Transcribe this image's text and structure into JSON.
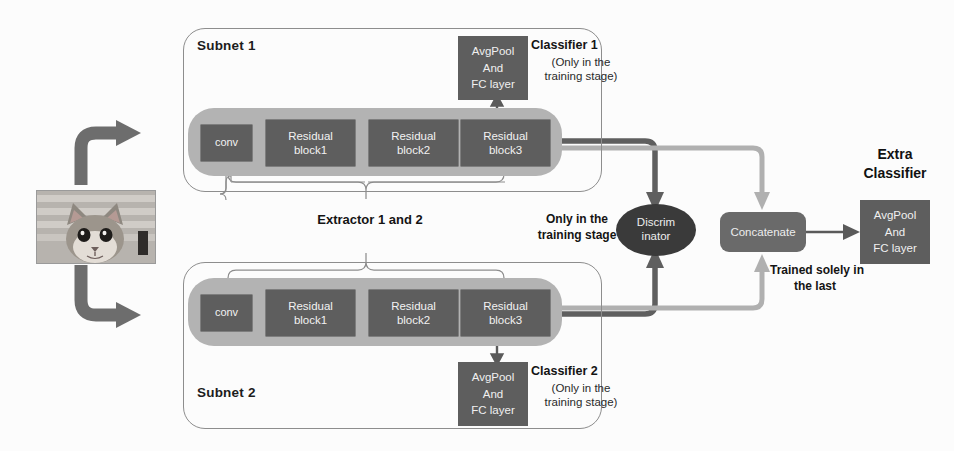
{
  "figure": {
    "type": "neural-network-architecture-diagram",
    "input": {
      "label": "cat-photo",
      "alt": "grayscale photo of a cat in front of striped blinds"
    },
    "subnets": [
      {
        "id": "subnet1",
        "title": "Subnet 1",
        "blocks": [
          "conv",
          "Residual\nblock1",
          "Residual\nblock2",
          "Residual\nblock3"
        ],
        "block_labels": {
          "conv": "conv",
          "res1_line1": "Residual",
          "res1_line2": "block1",
          "res2_line1": "Residual",
          "res2_line2": "block2",
          "res3_line1": "Residual",
          "res3_line2": "block3"
        },
        "classifier": {
          "box_line1": "AvgPool",
          "box_line2": "And",
          "box_line3": "FC layer",
          "title": "Classifier 1",
          "subtitle_line1": "(Only in the",
          "subtitle_line2": "training stage)"
        }
      },
      {
        "id": "subnet2",
        "title": "Subnet 2",
        "blocks": [
          "conv",
          "Residual\nblock1",
          "Residual\nblock2",
          "Residual\nblock3"
        ],
        "block_labels": {
          "conv": "conv",
          "res1_line1": "Residual",
          "res1_line2": "block1",
          "res2_line1": "Residual",
          "res2_line2": "block2",
          "res3_line1": "Residual",
          "res3_line2": "block3"
        },
        "classifier": {
          "box_line1": "AvgPool",
          "box_line2": "And",
          "box_line3": "FC layer",
          "title": "Classifier 2",
          "subtitle_line1": "(Only in the",
          "subtitle_line2": "training stage)"
        }
      }
    ],
    "extractor_label": "Extractor 1 and 2",
    "discriminator": {
      "line1": "Discrim",
      "line2": "inator",
      "note_line1": "Only in the",
      "note_line2": "training stage"
    },
    "concatenate": {
      "label": "Concatenate",
      "note_line1": "Trained solely in",
      "note_line2": "the last"
    },
    "extra_classifier": {
      "title_line1": "Extra",
      "title_line2": "Classifier",
      "box_line1": "AvgPool",
      "box_line2": "And",
      "box_line3": "FC layer"
    },
    "colors": {
      "dark_block": "#5e5e5e",
      "extractor_band": "#b3b3b3",
      "discriminator": "#3a3a3a",
      "concatenate": "#6a6a6a",
      "outline": "#8d8d8d",
      "arrow_dark": "#555555",
      "arrow_light": "#a6a6a6",
      "background": "#fcfcfc",
      "text_light": "#f0f0f0",
      "text_dark": "#141414"
    }
  }
}
